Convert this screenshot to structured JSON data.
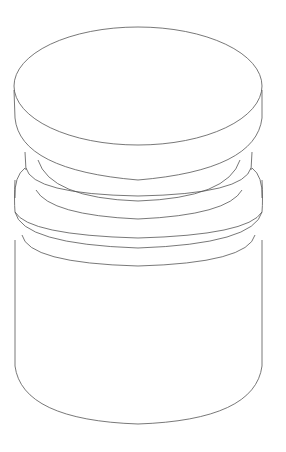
{
  "figure": {
    "stroke_color": "#555555",
    "background": "#ffffff",
    "parts": [
      "top-cap",
      "neck-groove-upper",
      "neck-groove-lower",
      "collar-ring",
      "base-body"
    ]
  }
}
